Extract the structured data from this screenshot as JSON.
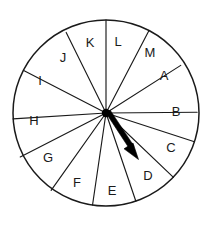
{
  "figure": {
    "name": "spinner-wheel",
    "title": "Spinner wheel with 13 equal sectors labeled A through M",
    "background_color": "#ffffff",
    "line_color": "#1a1a1a",
    "pointer_color": "#000000"
  },
  "wheel": {
    "center_x": 106,
    "center_y": 113,
    "radius": 93,
    "sector_count": 13,
    "sectors": [
      {
        "label": "A",
        "label_x": 164,
        "label_y": 75
      },
      {
        "label": "B",
        "label_x": 176,
        "label_y": 111
      },
      {
        "label": "C",
        "label_x": 171,
        "label_y": 147
      },
      {
        "label": "D",
        "label_x": 148,
        "label_y": 175
      },
      {
        "label": "E",
        "label_x": 112,
        "label_y": 190
      },
      {
        "label": "F",
        "label_x": 77,
        "label_y": 182
      },
      {
        "label": "G",
        "label_x": 48,
        "label_y": 157
      },
      {
        "label": "H",
        "label_x": 34,
        "label_y": 120
      },
      {
        "label": "I",
        "label_x": 40,
        "label_y": 80
      },
      {
        "label": "J",
        "label_x": 63,
        "label_y": 57
      },
      {
        "label": "K",
        "label_x": 90,
        "label_y": 42
      },
      {
        "label": "L",
        "label_x": 118,
        "label_y": 41
      },
      {
        "label": "M",
        "label_x": 150,
        "label_y": 52
      }
    ]
  },
  "pointer": {
    "name": "spinner-arrow",
    "points_to_sector": "D",
    "tip_x": 138,
    "tip_y": 159,
    "tail_x": 106,
    "tail_y": 113
  }
}
